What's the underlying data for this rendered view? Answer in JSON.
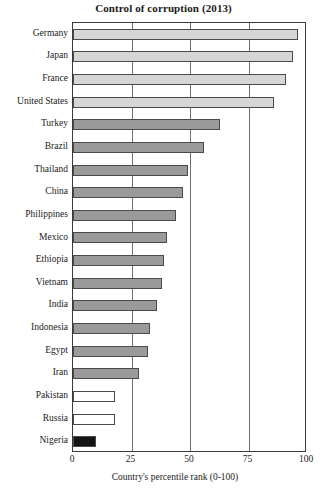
{
  "chart_data": {
    "type": "bar",
    "orientation": "horizontal",
    "title": "Control of corruption (2013)",
    "xlabel": "Country's percentile rank (0-100)",
    "ylabel": "",
    "xlim": [
      0,
      100
    ],
    "xticks": [
      0,
      25,
      50,
      75,
      100
    ],
    "grid": true,
    "legend": "none",
    "categories": [
      "Germany",
      "Japan",
      "France",
      "United States",
      "Turkey",
      "Brazil",
      "Thailand",
      "China",
      "Philippines",
      "Mexico",
      "Ethiopia",
      "Vietnam",
      "India",
      "Indonesia",
      "Egypt",
      "Iran",
      "Pakistan",
      "Russia",
      "Nigeria"
    ],
    "values": [
      96,
      94,
      91,
      86,
      63,
      56,
      49,
      47,
      44,
      40,
      39,
      38,
      36,
      33,
      32,
      28,
      18,
      18,
      10
    ],
    "bar_colors": [
      "#d6d6d6",
      "#d6d6d6",
      "#d6d6d6",
      "#d6d6d6",
      "#9a9a9a",
      "#9a9a9a",
      "#9a9a9a",
      "#9a9a9a",
      "#9a9a9a",
      "#9a9a9a",
      "#9a9a9a",
      "#9a9a9a",
      "#9a9a9a",
      "#9a9a9a",
      "#9a9a9a",
      "#9a9a9a",
      "#ffffff",
      "#ffffff",
      "#141414"
    ]
  },
  "axis": {
    "tick_labels": [
      "0",
      "25",
      "50",
      "75",
      "100"
    ]
  },
  "colors": {
    "axis": "#3a3a3a",
    "gridline": "#6f6f6f",
    "bar_border": "#4a4a4a",
    "text": "#1a1a1a",
    "background": "#ffffff"
  }
}
